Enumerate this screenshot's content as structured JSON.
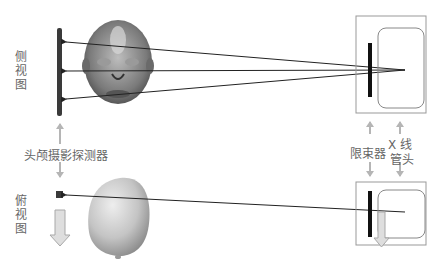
{
  "labels": {
    "side_view": "侧视图",
    "top_view": "俯视图",
    "detector": "头颅摄影探测器",
    "collimator": "限束器",
    "xray_tube_line1": "X 线",
    "xray_tube_line2": "管头"
  },
  "colors": {
    "detector": "#3a3a3a",
    "collimator": "#111111",
    "box_border": "#999999",
    "tube_border": "#888888",
    "ray": "#222222",
    "arrow": "#b5b5b5",
    "head": "#c8c8c8",
    "text": "#666666"
  }
}
